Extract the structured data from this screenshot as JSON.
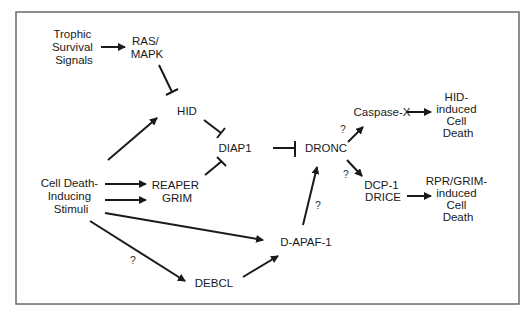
{
  "diagram": {
    "type": "signaling-pathway",
    "frame_color": "#6a6a6a",
    "ink_color": "#1a1a1a",
    "nodes": {
      "trophic": {
        "lines": [
          "Trophic",
          "Survival",
          "Signals"
        ]
      },
      "rasmapk": {
        "lines": [
          "RAS/",
          "MAPK"
        ]
      },
      "hid": {
        "lines": [
          "HID"
        ]
      },
      "diap1": {
        "lines": [
          "DIAP1"
        ]
      },
      "dronc": {
        "lines": [
          "DRONC"
        ]
      },
      "celldeath": {
        "lines": [
          "Cell Death-",
          "Inducing",
          "Stimuli"
        ]
      },
      "reapergrim": {
        "lines": [
          "REAPER",
          "GRIM"
        ]
      },
      "dapaf1": {
        "lines": [
          "D-APAF-1"
        ]
      },
      "debcl": {
        "lines": [
          "DEBCL"
        ]
      },
      "caspasex": {
        "lines": [
          "Caspase-X"
        ]
      },
      "hiddeath": {
        "lines": [
          "HID-",
          "induced",
          "Cell",
          "Death"
        ]
      },
      "dcp1drice": {
        "lines": [
          "DCP-1",
          "DRICE"
        ]
      },
      "rprgrimdeath": {
        "lines": [
          "RPR/GRIM-",
          "induced",
          "Cell",
          "Death"
        ]
      }
    },
    "edges": [
      {
        "from": "Trophic Survival Signals",
        "to": "RAS/MAPK",
        "kind": "activation"
      },
      {
        "from": "RAS/MAPK",
        "to": "HID",
        "kind": "inhibition"
      },
      {
        "from": "Cell Death-Inducing Stimuli",
        "to": "HID",
        "kind": "activation"
      },
      {
        "from": "Cell Death-Inducing Stimuli",
        "to": "REAPER",
        "kind": "activation"
      },
      {
        "from": "Cell Death-Inducing Stimuli",
        "to": "GRIM",
        "kind": "activation"
      },
      {
        "from": "Cell Death-Inducing Stimuli",
        "to": "D-APAF-1",
        "kind": "activation"
      },
      {
        "from": "Cell Death-Inducing Stimuli",
        "to": "DEBCL",
        "kind": "activation",
        "label": "?"
      },
      {
        "from": "HID",
        "to": "DIAP1",
        "kind": "inhibition"
      },
      {
        "from": "REAPER GRIM",
        "to": "DIAP1",
        "kind": "inhibition"
      },
      {
        "from": "DIAP1",
        "to": "DRONC",
        "kind": "inhibition"
      },
      {
        "from": "DEBCL",
        "to": "D-APAF-1",
        "kind": "activation"
      },
      {
        "from": "D-APAF-1",
        "to": "DRONC",
        "kind": "activation",
        "label": "?"
      },
      {
        "from": "DRONC",
        "to": "Caspase-X",
        "kind": "activation",
        "label": "?"
      },
      {
        "from": "DRONC",
        "to": "DCP-1 DRICE",
        "kind": "activation",
        "label": "?"
      },
      {
        "from": "Caspase-X",
        "to": "HID-induced Cell Death",
        "kind": "activation"
      },
      {
        "from": "DCP-1 DRICE",
        "to": "RPR/GRIM-induced Cell Death",
        "kind": "activation"
      }
    ],
    "uncertain_labels": {
      "debcl": "?",
      "dapaf_dronc": "?",
      "dronc_caspasex": "?",
      "dronc_dcp1": "?"
    }
  }
}
